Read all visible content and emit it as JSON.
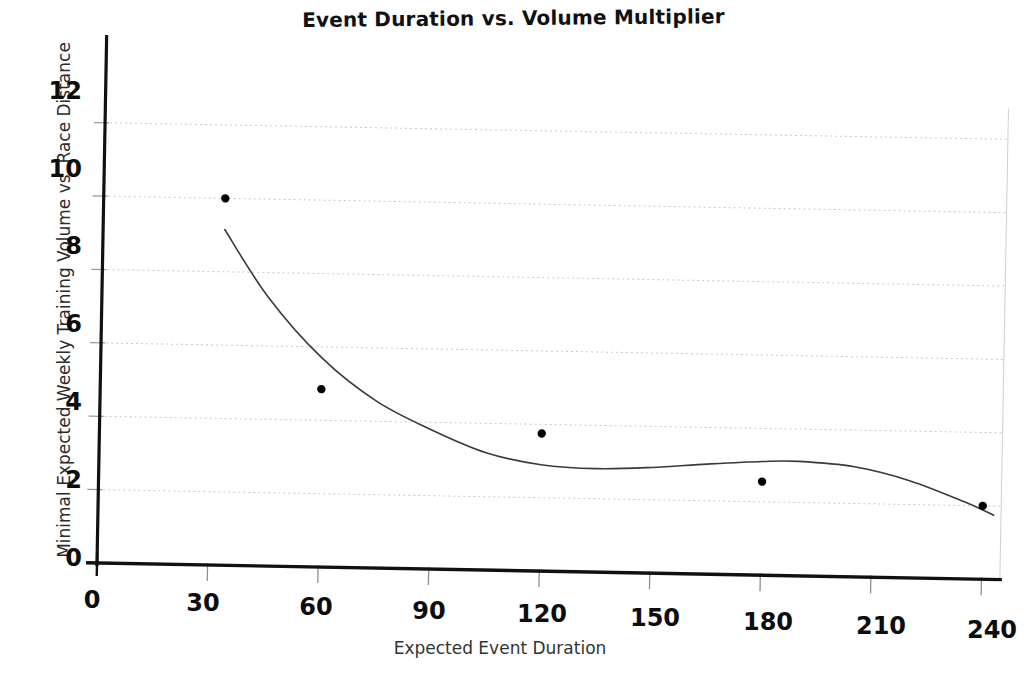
{
  "chart_data": {
    "type": "scatter",
    "title": "Event Duration vs. Volume Multiplier",
    "xlabel": "Expected Event Duration",
    "ylabel": "Minimal Expected Weekly Training Volume vs. Race Distance",
    "xlim": [
      0,
      245
    ],
    "ylim": [
      0,
      13
    ],
    "xticks": [
      0,
      30,
      60,
      90,
      120,
      150,
      180,
      210,
      240
    ],
    "yticks": [
      0,
      2,
      4,
      6,
      8,
      10,
      12
    ],
    "grid": "horizontal-dashed",
    "legend": "none",
    "series": [
      {
        "name": "observations",
        "marker": "filled-circle",
        "color": "#000000",
        "points": [
          {
            "x": 33,
            "y": 10.0
          },
          {
            "x": 60,
            "y": 4.85
          },
          {
            "x": 120,
            "y": 3.75
          },
          {
            "x": 180,
            "y": 2.55
          },
          {
            "x": 240,
            "y": 2.0
          }
        ]
      },
      {
        "name": "fitted-trend-curve",
        "marker": "none",
        "style": "smooth-line",
        "color": "#3a3a3a",
        "points": [
          {
            "x": 33,
            "y": 9.15
          },
          {
            "x": 45,
            "y": 7.35
          },
          {
            "x": 60,
            "y": 5.7
          },
          {
            "x": 75,
            "y": 4.55
          },
          {
            "x": 90,
            "y": 3.8
          },
          {
            "x": 105,
            "y": 3.2
          },
          {
            "x": 120,
            "y": 2.9
          },
          {
            "x": 135,
            "y": 2.82
          },
          {
            "x": 150,
            "y": 2.88
          },
          {
            "x": 165,
            "y": 3.0
          },
          {
            "x": 180,
            "y": 3.1
          },
          {
            "x": 190,
            "y": 3.12
          },
          {
            "x": 205,
            "y": 3.0
          },
          {
            "x": 220,
            "y": 2.65
          },
          {
            "x": 235,
            "y": 2.1
          },
          {
            "x": 243,
            "y": 1.75
          }
        ]
      }
    ]
  },
  "labels": {
    "ytick_0": "0",
    "ytick_2": "2",
    "ytick_4": "4",
    "ytick_6": "6",
    "ytick_8": "8",
    "ytick_10": "10",
    "ytick_12": "12",
    "xtick_0": "0",
    "xtick_30": "30",
    "xtick_60": "60",
    "xtick_90": "90",
    "xtick_120": "120",
    "xtick_150": "150",
    "xtick_180": "180",
    "xtick_210": "210",
    "xtick_240": "240"
  },
  "style": {
    "axis_color": "#111111",
    "grid_color": "#c9c9c9",
    "curve_color": "#3a3a3a",
    "marker_color": "#000000",
    "background": "#ffffff"
  }
}
